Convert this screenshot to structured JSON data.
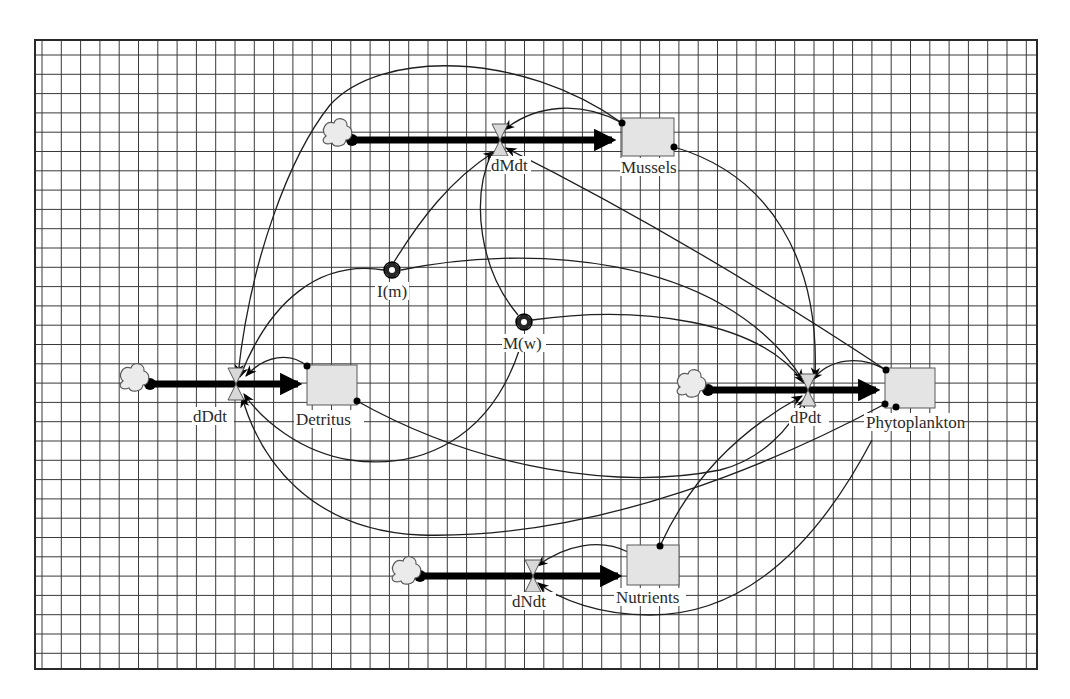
{
  "diagram": {
    "type": "stock-and-flow",
    "grid": {
      "x0": 35,
      "y0": 40,
      "x1": 1037,
      "y1": 669,
      "spacing": 19.3,
      "line_color": "#3a3a3a",
      "frame_color": "#2a2a2a"
    },
    "stocks": [
      {
        "id": "mussels",
        "label": "Mussels",
        "x": 622,
        "y": 118,
        "w": 52,
        "h": 38
      },
      {
        "id": "detritus",
        "label": "Detritus",
        "x": 307,
        "y": 365,
        "w": 50,
        "h": 40
      },
      {
        "id": "phytoplankton",
        "label": "Phytoplankton",
        "x": 885,
        "y": 368,
        "w": 50,
        "h": 40
      },
      {
        "id": "nutrients",
        "label": "Nutrients",
        "x": 627,
        "y": 545,
        "w": 52,
        "h": 40
      }
    ],
    "flows": [
      {
        "id": "dMdt",
        "label": "dMdt",
        "valve_x": 500,
        "y": 140,
        "cloud_x": 336,
        "stock_id": "mussels"
      },
      {
        "id": "dDdt",
        "label": "dDdt",
        "valve_x": 236,
        "y": 384,
        "cloud_x": 133,
        "stock_id": "detritus"
      },
      {
        "id": "dPdt",
        "label": "dPdt",
        "valve_x": 808,
        "y": 390,
        "cloud_x": 690,
        "stock_id": "phytoplankton"
      },
      {
        "id": "dNdt",
        "label": "dNdt",
        "valve_x": 533,
        "y": 576,
        "cloud_x": 405,
        "stock_id": "nutrients"
      }
    ],
    "converters": [
      {
        "id": "Im",
        "label": "I(m)",
        "x": 392,
        "y": 270
      },
      {
        "id": "Mw",
        "label": "M(w)",
        "x": 524,
        "y": 322
      }
    ],
    "labels": {
      "mussels": "Mussels",
      "detritus": "Detritus",
      "phytoplankton": "Phytoplankton",
      "nutrients": "Nutrients",
      "dMdt": "dMdt",
      "dDdt": "dDdt",
      "dPdt": "dPdt",
      "dNdt": "dNdt",
      "Im": "I(m)",
      "Mw": "M(w)"
    },
    "colors": {
      "stock_fill": "#e4e4e4",
      "cloud_fill": "#ebebeb",
      "valve_fill": "#d8d8d8",
      "pipe": "#000000",
      "connector": "#1f1f1f",
      "background": "#ffffff"
    }
  }
}
